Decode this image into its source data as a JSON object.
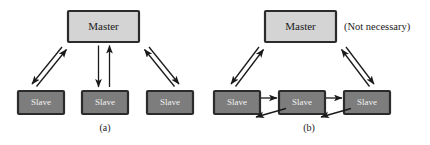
{
  "figure": {
    "background_color": "#ffffff",
    "master_fill": "#d4d4d4",
    "master_stroke": "#2b2b2b",
    "master_text_color": "#1a1a1a",
    "slave_fill": "#7d7d7d",
    "slave_stroke": "#2b2b2b",
    "slave_text_color": "#f2f2f2",
    "arrow_color": "#1a1a1a"
  },
  "panels": [
    {
      "id": "panel-a",
      "caption": "(a)",
      "note": "",
      "master": {
        "label": "Master"
      },
      "slaves": [
        {
          "label": "Slave"
        },
        {
          "label": "Slave"
        },
        {
          "label": "Slave"
        }
      ],
      "links": [
        {
          "from": "slave-1",
          "to": "master",
          "style": "bidirectional-pair"
        },
        {
          "from": "slave-2",
          "to": "master",
          "style": "bidirectional-pair"
        },
        {
          "from": "slave-3",
          "to": "master",
          "style": "bidirectional-pair"
        }
      ]
    },
    {
      "id": "panel-b",
      "caption": "(b)",
      "note": "(Not necessary)",
      "master": {
        "label": "Master"
      },
      "slaves": [
        {
          "label": "Slave"
        },
        {
          "label": "Slave"
        },
        {
          "label": "Slave"
        }
      ],
      "links": [
        {
          "from": "slave-1",
          "to": "master",
          "style": "bidirectional-pair"
        },
        {
          "from": "slave-3",
          "to": "master",
          "style": "bidirectional-pair"
        },
        {
          "from": "slave-1",
          "to": "slave-2",
          "style": "bidirectional-pair"
        },
        {
          "from": "slave-2",
          "to": "slave-3",
          "style": "bidirectional-pair"
        }
      ]
    }
  ]
}
